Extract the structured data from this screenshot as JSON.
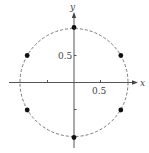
{
  "diagram": {
    "axes": {
      "x_label": "x",
      "y_label": "y",
      "x_tick_label": "0.5",
      "y_tick_label": "0.5"
    },
    "circle": {
      "radius": 1,
      "style": "dashed"
    },
    "points": [
      {
        "angle_deg": 30,
        "x": 0.866,
        "y": 0.5
      },
      {
        "angle_deg": 90,
        "x": 0,
        "y": 1
      },
      {
        "angle_deg": 150,
        "x": -0.866,
        "y": 0.5
      },
      {
        "angle_deg": 210,
        "x": -0.866,
        "y": -0.5
      },
      {
        "angle_deg": 270,
        "x": 0,
        "y": -1
      },
      {
        "angle_deg": 330,
        "x": 0.866,
        "y": -0.5
      }
    ],
    "colors": {
      "axis": "#555555",
      "circle": "#6a6a6a",
      "dot": "#111111"
    }
  }
}
